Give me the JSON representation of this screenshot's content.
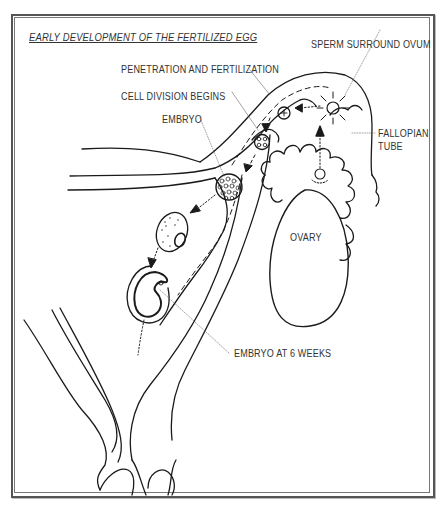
{
  "diagram": {
    "title": "EARLY DEVELOPMENT OF THE FERTILIZED EGG",
    "labels": {
      "sperm_surround_ovum": "SPERM SURROUND OVUM",
      "penetration_fertilization": "PENETRATION AND FERTILIZATION",
      "cell_division": "CELL DIVISION BEGINS",
      "embryo": "EMBRYO",
      "fallopian_tube_line1": "FALLOPIAN",
      "fallopian_tube_line2": "TUBE",
      "ovary": "OVARY",
      "embryo_6_weeks": "EMBRYO AT 6 WEEKS"
    },
    "stages": [
      "Sperm surround ovum",
      "Penetration and fertilization",
      "Cell division begins",
      "Embryo",
      "Embryo at 6 weeks"
    ],
    "colors": {
      "line": "#1a1a1a",
      "text": "#333333",
      "frame": "#555555"
    }
  }
}
